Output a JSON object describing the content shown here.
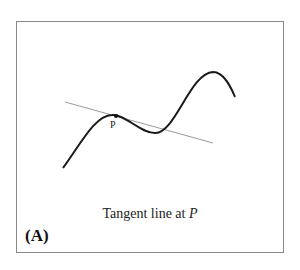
{
  "figure": {
    "panel_label": "(A)",
    "caption_text": "Tangent line at ",
    "caption_var": "P",
    "point_label": "P"
  },
  "colors": {
    "curve": "#1a1a1a",
    "tangent": "#9a9a9a",
    "frame": "#8a8a8a"
  }
}
